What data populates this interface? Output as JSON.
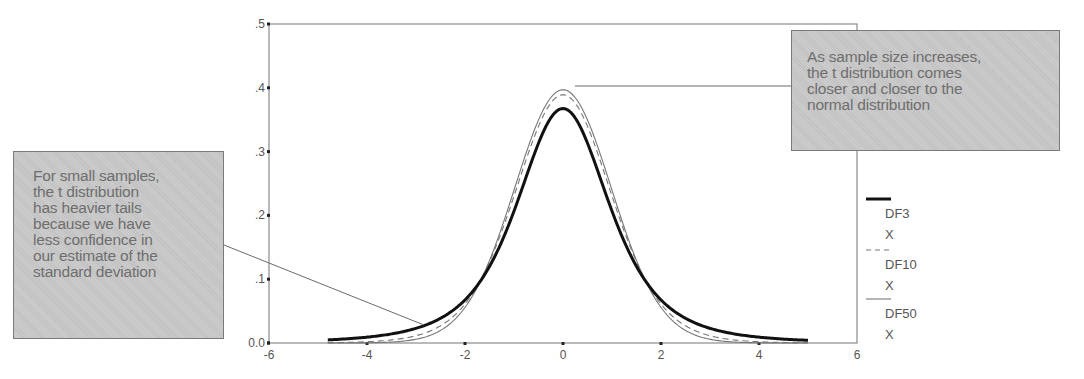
{
  "chart_data": {
    "type": "line",
    "title": "",
    "xlabel": "",
    "ylabel": "",
    "xlim": [
      -6,
      6
    ],
    "ylim": [
      0.0,
      0.5
    ],
    "x_ticks": [
      "-6",
      "-4",
      "-2",
      "0",
      "2",
      "4",
      "6"
    ],
    "y_ticks": [
      "0.0",
      ".1",
      ".2",
      ".3",
      ".4",
      ".5"
    ],
    "grid": false,
    "legend_position": "right",
    "x_range_plotted": [
      -4.8,
      5.0
    ],
    "series": [
      {
        "name": "DF3",
        "legend_lines": [
          "DF3",
          "X"
        ],
        "df": 3,
        "style": "thick-solid",
        "color": "#111111",
        "x": [
          -4.8,
          -4,
          -3,
          -2,
          -1,
          0,
          1,
          2,
          3,
          4,
          5
        ],
        "values": [
          0.007,
          0.013,
          0.023,
          0.068,
          0.207,
          0.368,
          0.207,
          0.068,
          0.023,
          0.013,
          0.004
        ]
      },
      {
        "name": "DF10",
        "legend_lines": [
          "DF10",
          "X"
        ],
        "df": 10,
        "style": "dashed",
        "color": "#777777",
        "x": [
          -4.8,
          -4,
          -3,
          -2,
          -1,
          0,
          1,
          2,
          3,
          4,
          5
        ],
        "values": [
          0.001,
          0.002,
          0.011,
          0.061,
          0.23,
          0.389,
          0.23,
          0.061,
          0.011,
          0.002,
          0.0005
        ]
      },
      {
        "name": "DF50",
        "legend_lines": [
          "DF50",
          "X"
        ],
        "df": 50,
        "style": "thin-solid",
        "color": "#777777",
        "x": [
          -4.8,
          -4,
          -3,
          -2,
          -1,
          0,
          1,
          2,
          3,
          4,
          5
        ],
        "values": [
          0.0,
          0.0002,
          0.005,
          0.055,
          0.24,
          0.397,
          0.24,
          0.055,
          0.005,
          0.0002,
          0.0
        ]
      }
    ],
    "annotations": [
      {
        "id": "small-samples",
        "lines": [
          "For small samples,",
          "the t distribution",
          "has heavier tails",
          "because we have",
          "less confidence in",
          "our estimate of the",
          "standard deviation"
        ]
      },
      {
        "id": "large-samples",
        "lines": [
          "As sample size increases,",
          "the t distribution comes",
          "closer and closer to the",
          "normal distribution"
        ]
      }
    ]
  }
}
